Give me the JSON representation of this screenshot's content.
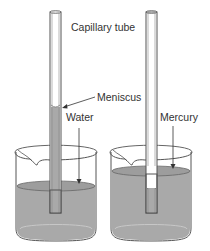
{
  "labels": {
    "capillary_tube": "Capillary tube",
    "meniscus": "Meniscus",
    "water": "Water",
    "mercury": "Mercury"
  },
  "colors": {
    "liquid": "#a9a9a9",
    "liquid_dark": "#8f8f8f",
    "glass_outline": "#555555",
    "text": "#333333",
    "background": "#ffffff"
  },
  "setups": [
    {
      "liquid": "Water",
      "tube_level": "raised above beaker surface (concave meniscus)"
    },
    {
      "liquid": "Mercury",
      "tube_level": "depressed below beaker surface (convex meniscus)"
    }
  ]
}
